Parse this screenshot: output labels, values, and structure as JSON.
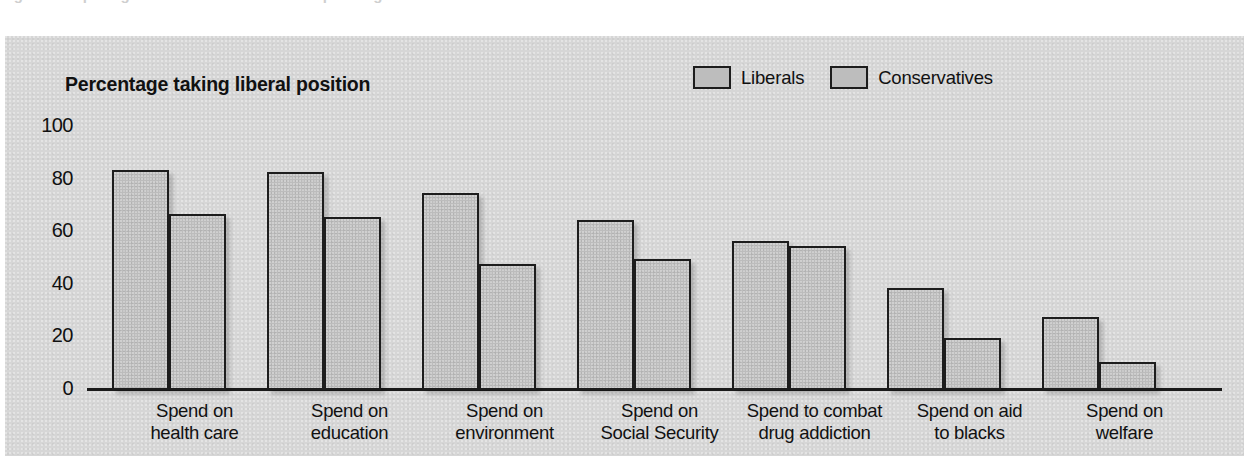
{
  "top_caption_remnant": "Figure  comparing liberal and conservative spending attitudes",
  "figure": {
    "axis_title": "Percentage taking liberal position",
    "legend": [
      {
        "label": "Liberals",
        "swatch_color": "#bdbdbd"
      },
      {
        "label": "Conservatives",
        "swatch_color": "#bdbdbd"
      }
    ],
    "panel_color": "#d6d6d6",
    "bar_fill_color": "#bcbcbc",
    "bar_outline_color": "#1d1d1d"
  },
  "chart_data": {
    "type": "bar",
    "title": "Percentage taking liberal position",
    "xlabel": "",
    "ylabel": "Percentage taking liberal position",
    "ylim": [
      0,
      100
    ],
    "yticks": [
      0,
      20,
      40,
      60,
      80,
      100
    ],
    "grid": false,
    "legend_position": "top-right",
    "categories": [
      "Spend on health care",
      "Spend on education",
      "Spend on environment",
      "Spend on Social Security",
      "Spend to combat drug addiction",
      "Spend on aid to blacks",
      "Spend on welfare"
    ],
    "category_lines": [
      [
        "Spend on",
        "health care"
      ],
      [
        "Spend on",
        "education"
      ],
      [
        "Spend on",
        "environment"
      ],
      [
        "Spend on",
        "Social Security"
      ],
      [
        "Spend to combat",
        "drug addiction"
      ],
      [
        "Spend on aid",
        "to blacks"
      ],
      [
        "Spend on",
        "welfare"
      ]
    ],
    "series": [
      {
        "name": "Liberals",
        "values": [
          83,
          82,
          74,
          64,
          56,
          38,
          27
        ]
      },
      {
        "name": "Conservatives",
        "values": [
          66,
          65,
          47,
          49,
          54,
          19,
          10
        ]
      }
    ]
  }
}
